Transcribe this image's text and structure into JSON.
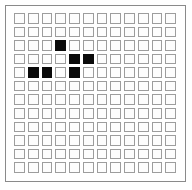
{
  "board": {
    "title": "cellular-automaton-grid",
    "columns": 12,
    "rows": 12,
    "cell_state_empty": "empty",
    "cell_state_filled": "filled",
    "colors": {
      "filled_cell": "#0a0a0a",
      "empty_cell": "#fdfdfd",
      "cell_border": "#9d9d9d",
      "panel_border": "#8a8a8a",
      "background": "#ffffff"
    },
    "filled_cells": [
      {
        "row": 3,
        "col": 4
      },
      {
        "row": 4,
        "col": 5
      },
      {
        "row": 4,
        "col": 6
      },
      {
        "row": 5,
        "col": 2
      },
      {
        "row": 5,
        "col": 3
      },
      {
        "row": 5,
        "col": 5
      }
    ],
    "filled_count": 6,
    "cells": [
      [
        0,
        0,
        0,
        0,
        0,
        0,
        0,
        0,
        0,
        0,
        0,
        0
      ],
      [
        0,
        0,
        0,
        0,
        0,
        0,
        0,
        0,
        0,
        0,
        0,
        0
      ],
      [
        0,
        0,
        0,
        1,
        0,
        0,
        0,
        0,
        0,
        0,
        0,
        0
      ],
      [
        0,
        0,
        0,
        0,
        1,
        1,
        0,
        0,
        0,
        0,
        0,
        0
      ],
      [
        0,
        1,
        1,
        0,
        1,
        0,
        0,
        0,
        0,
        0,
        0,
        0
      ],
      [
        0,
        0,
        0,
        0,
        0,
        0,
        0,
        0,
        0,
        0,
        0,
        0
      ],
      [
        0,
        0,
        0,
        0,
        0,
        0,
        0,
        0,
        0,
        0,
        0,
        0
      ],
      [
        0,
        0,
        0,
        0,
        0,
        0,
        0,
        0,
        0,
        0,
        0,
        0
      ],
      [
        0,
        0,
        0,
        0,
        0,
        0,
        0,
        0,
        0,
        0,
        0,
        0
      ],
      [
        0,
        0,
        0,
        0,
        0,
        0,
        0,
        0,
        0,
        0,
        0,
        0
      ],
      [
        0,
        0,
        0,
        0,
        0,
        0,
        0,
        0,
        0,
        0,
        0,
        0
      ],
      [
        0,
        0,
        0,
        0,
        0,
        0,
        0,
        0,
        0,
        0,
        0,
        0
      ]
    ]
  }
}
